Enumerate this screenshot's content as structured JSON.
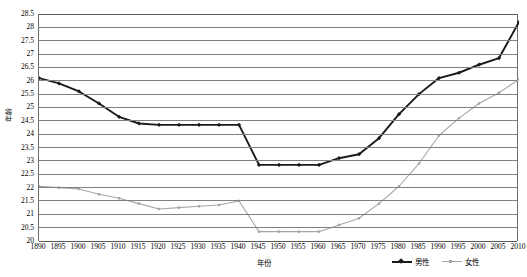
{
  "chart_data": {
    "type": "line",
    "title": "",
    "xlabel": "年份",
    "ylabel": "年龄",
    "xlim": [
      1890,
      2010
    ],
    "ylim": [
      20,
      28.5
    ],
    "ytick_step": 0.5,
    "xtick_step": 5,
    "grid": true,
    "legend_position": "bottom-right",
    "categories": [
      1890,
      1895,
      1900,
      1905,
      1910,
      1915,
      1920,
      1925,
      1930,
      1935,
      1940,
      1945,
      1950,
      1955,
      1960,
      1965,
      1970,
      1975,
      1980,
      1985,
      1990,
      1995,
      2000,
      2005,
      2010
    ],
    "xticklabels": [
      "1890",
      "1895",
      "1900",
      "1905",
      "1910",
      "1915",
      "1920",
      "1925",
      "1930",
      "1935",
      "1940",
      "1945",
      "1950",
      "1955",
      "1960",
      "1965",
      "1970",
      "1975",
      "1980",
      "1985",
      "1990",
      "1995",
      "2000",
      "2005",
      "2010"
    ],
    "yticklabels": [
      "20",
      "20.5",
      "21",
      "21.5",
      "22",
      "22.5",
      "23",
      "23.5",
      "24",
      "24.5",
      "25",
      "25.5",
      "26",
      "26.5",
      "27",
      "27.5",
      "28",
      "28.5"
    ],
    "yticks": [
      20,
      20.5,
      21,
      21.5,
      22,
      22.5,
      23,
      23.5,
      24,
      24.5,
      25,
      25.5,
      26,
      26.5,
      27,
      27.5,
      28,
      28.5
    ],
    "series": [
      {
        "name": "男性",
        "color": "#1a1a1a",
        "marker": "diamond",
        "values": [
          26.1,
          25.9,
          25.6,
          25.15,
          24.65,
          24.4,
          24.35,
          24.35,
          24.35,
          24.35,
          24.35,
          22.85,
          22.85,
          22.85,
          22.85,
          23.1,
          23.25,
          23.85,
          24.75,
          25.5,
          26.1,
          26.3,
          26.6,
          26.85,
          28.2
        ]
      },
      {
        "name": "女性",
        "color": "#a6a6a6",
        "marker": "square",
        "values": [
          22.05,
          22.0,
          21.95,
          21.75,
          21.6,
          21.4,
          21.2,
          21.25,
          21.3,
          21.35,
          21.5,
          20.35,
          20.35,
          20.35,
          20.35,
          20.6,
          20.85,
          21.4,
          22.05,
          22.9,
          23.95,
          24.6,
          25.15,
          25.55,
          26.05
        ]
      }
    ]
  },
  "legend": {
    "male_label": "男性",
    "female_label": "女性"
  },
  "axis": {
    "y_title": "年龄",
    "x_title": "年份"
  }
}
